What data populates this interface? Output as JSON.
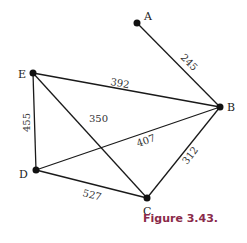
{
  "caption": "Figure 3.43.",
  "colors": {
    "caption": "#8a2a4a",
    "edges": "#1a1a1a",
    "nodes": "#111111"
  },
  "nodes": [
    {
      "id": "A",
      "label": "A",
      "x": 137,
      "y": 23
    },
    {
      "id": "B",
      "label": "B",
      "x": 220,
      "y": 107
    },
    {
      "id": "C",
      "label": "C",
      "x": 147,
      "y": 198
    },
    {
      "id": "D",
      "label": "D",
      "x": 36,
      "y": 170
    },
    {
      "id": "E",
      "label": "E",
      "x": 33,
      "y": 73
    }
  ],
  "edges": [
    {
      "from": "A",
      "to": "B",
      "weight": "245"
    },
    {
      "from": "E",
      "to": "B",
      "weight": "392"
    },
    {
      "from": "E",
      "to": "C",
      "weight": "350"
    },
    {
      "from": "E",
      "to": "D",
      "weight": "455"
    },
    {
      "from": "D",
      "to": "B",
      "weight": "407"
    },
    {
      "from": "D",
      "to": "C",
      "weight": "527"
    },
    {
      "from": "C",
      "to": "B",
      "weight": "312"
    }
  ]
}
